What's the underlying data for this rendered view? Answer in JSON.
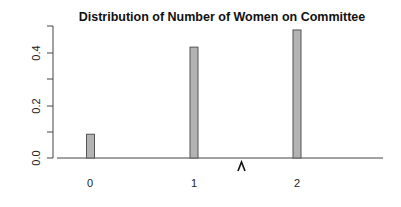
{
  "chart_data": {
    "type": "bar",
    "title": "Distribution of Number of Women on Committee",
    "xlabel": "",
    "ylabel": "",
    "categories": [
      "0",
      "1",
      "2"
    ],
    "values": [
      0.09,
      0.42,
      0.485
    ],
    "ylim": [
      0,
      0.5
    ],
    "yticks": [
      0.0,
      0.1,
      0.2,
      0.3,
      0.4,
      0.5
    ],
    "ytick_labels": [
      "0.0",
      "0.2",
      "0.4"
    ],
    "grid": false,
    "legend": null,
    "annotations": [
      "^"
    ],
    "bar_color": "#b3b3b3",
    "bar_edge_color": "#555555"
  },
  "labels": {
    "title": "Distribution of Number of Women on Committee",
    "x_ticks": [
      "0",
      "1",
      "2"
    ],
    "y_ticks": [
      "0.0",
      "0.2",
      "0.4"
    ],
    "caret": "^"
  }
}
